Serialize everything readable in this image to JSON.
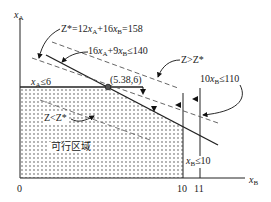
{
  "axes": {
    "y_label_var": "x",
    "y_label_sub": "A",
    "x_label_var": "x",
    "x_label_sub": "B",
    "origin": "0",
    "x_ticks": [
      "10",
      "11"
    ]
  },
  "labels": {
    "objective_prefix": "Z*=12",
    "objective_mid": "+16",
    "objective_suffix": "=158",
    "constraint_1_prefix": "16",
    "constraint_1_mid": "+9",
    "constraint_1_suffix": "≤140",
    "constraint_xa_suffix": "≤6",
    "constraint_10xb_prefix": "10",
    "constraint_10xb_suffix": "≤110",
    "constraint_xb_suffix": "≤10",
    "optimal_point": "(5.38,6)",
    "z_greater": "Z>Z*",
    "z_less": "Z<Z*",
    "feasible_region": "可行区域"
  },
  "colors": {
    "line": "#222222",
    "dashed": "#555555",
    "dots": "#333333"
  }
}
